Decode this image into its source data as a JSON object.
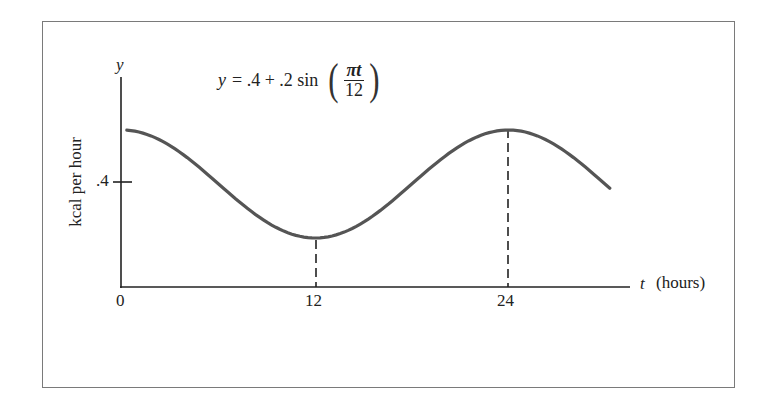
{
  "chart_data": {
    "type": "line",
    "formula": {
      "lhs": "y",
      "rhs_prefix": "= .4 + .2 sin",
      "numerator": "πt",
      "denominator": "12"
    },
    "xlabel": "t",
    "xlabel_unit": "(hours)",
    "ylabel_axis": "y",
    "ylabel": "kcal per hour",
    "x_ticks": [
      "0",
      "12",
      "24"
    ],
    "y_ticks": [
      ".4"
    ],
    "xlim": [
      0,
      30.5
    ],
    "ylim": [
      0,
      0.75
    ],
    "series": [
      {
        "name": "y = .4 + .2 sin(πt/12)",
        "function": "0.4 + 0.2*cos(pi*t/12)",
        "x": [
          0,
          3,
          6,
          9,
          12,
          15,
          18,
          21,
          24,
          27,
          30
        ],
        "values": [
          0.6,
          0.585,
          0.4,
          0.259,
          0.2,
          0.259,
          0.4,
          0.541,
          0.6,
          0.541,
          0.4
        ]
      }
    ],
    "annotations": [
      {
        "type": "dashed-vertical",
        "x": 12,
        "label": "minimum"
      },
      {
        "type": "dashed-vertical",
        "x": 24,
        "label": "maximum"
      }
    ],
    "grid": false,
    "legend": "none",
    "colors": {
      "curve": "#555555",
      "axes": "#222222",
      "frame": "#7a7a7a"
    }
  }
}
